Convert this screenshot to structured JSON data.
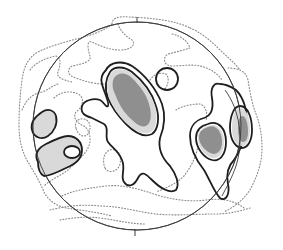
{
  "diagram": {
    "type": "stereonet-contour-plot",
    "primitive_circle": {
      "cx": 137,
      "cy": 126,
      "r": 104
    },
    "north_tick": "N",
    "south_tick": "S",
    "colors": {
      "background": "#ffffff",
      "outline": "#1e1e1e",
      "net_circle": "#3a3a3a",
      "dotted_contour": "#8a8a8a",
      "light_fill": "#d9d9d9",
      "dark_fill": "#8f8f8f"
    },
    "contour_levels": [
      {
        "style": "dotted",
        "meaning": "lowest density"
      },
      {
        "style": "solid",
        "meaning": "intermediate density"
      },
      {
        "style": "light-gray-fill",
        "meaning": "high density"
      },
      {
        "style": "dark-gray-fill",
        "meaning": "maximum density"
      }
    ],
    "maxima": [
      {
        "id": "central-elongate",
        "location": "center-upper-left",
        "fill": "dark"
      },
      {
        "id": "east-lower",
        "location": "east",
        "fill": "dark"
      },
      {
        "id": "east-upper",
        "location": "east edge",
        "fill": "dark"
      },
      {
        "id": "west-pair",
        "location": "west edge",
        "fill": "light"
      }
    ]
  }
}
